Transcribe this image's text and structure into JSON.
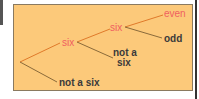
{
  "diagram": {
    "type": "probability-tree",
    "nodes": {
      "six_1": "six",
      "not_six_1": "not a six",
      "six_2": "six",
      "not_six_2": "not a\nsix",
      "even": "even",
      "odd": "odd"
    },
    "colors": {
      "background": "#fcc97a",
      "highlight": "#f06060",
      "text": "#3a3a3a",
      "branch_highlight": "#e07a2a",
      "branch_plain": "#8a6a3a"
    }
  }
}
